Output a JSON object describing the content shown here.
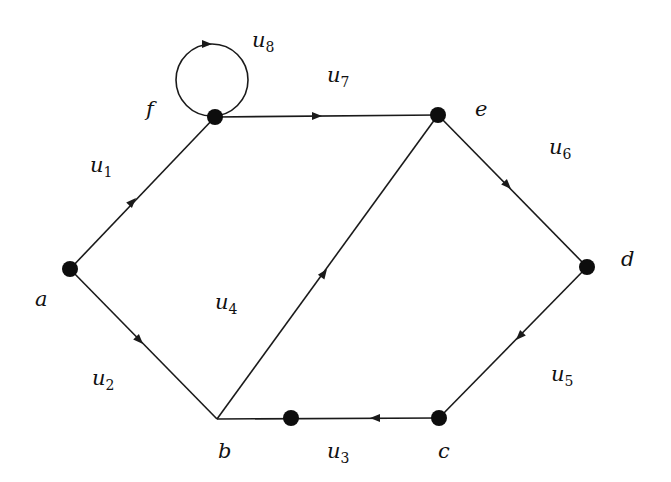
{
  "diagram": {
    "type": "directed-graph",
    "vertices": [
      {
        "id": "a",
        "label": "a",
        "x": 70,
        "y": 269,
        "lx": 35,
        "ly": 306,
        "dot": true
      },
      {
        "id": "b",
        "label": "b",
        "x": 217,
        "y": 419,
        "lx": 218,
        "ly": 458,
        "dot": false
      },
      {
        "id": "c",
        "label": "c",
        "x": 439,
        "y": 418,
        "lx": 438,
        "ly": 458,
        "dot": true
      },
      {
        "id": "d",
        "label": "d",
        "x": 587,
        "y": 267,
        "lx": 621,
        "ly": 266,
        "dot": true
      },
      {
        "id": "e",
        "label": "e",
        "x": 438,
        "y": 115,
        "lx": 475,
        "ly": 116,
        "dot": true
      },
      {
        "id": "f",
        "label": "f",
        "x": 215,
        "y": 117,
        "lx": 146,
        "ly": 116,
        "dot": true
      },
      {
        "id": "m",
        "label": "",
        "x": 291,
        "y": 418,
        "dot": true
      }
    ],
    "edges": [
      {
        "id": "u1",
        "name": "u",
        "sub": "1",
        "from": "a",
        "to": "f",
        "lx": 90,
        "ly": 172,
        "ax": 136,
        "ay": 198
      },
      {
        "id": "u2",
        "name": "u",
        "sub": "2",
        "from": "a",
        "to": "b",
        "lx": 92,
        "ly": 385,
        "ax": 143,
        "ay": 344
      },
      {
        "id": "u3",
        "name": "u",
        "sub": "3",
        "from": "c",
        "to": "b",
        "lx": 327,
        "ly": 458,
        "ax": 373,
        "ay": 418
      },
      {
        "id": "u4",
        "name": "u",
        "sub": "4",
        "from": "b",
        "to": "e",
        "lx": 215,
        "ly": 309,
        "ax": 325,
        "ay": 272
      },
      {
        "id": "u5",
        "name": "u",
        "sub": "5",
        "from": "d",
        "to": "c",
        "lx": 551,
        "ly": 381,
        "ax": 518,
        "ay": 338
      },
      {
        "id": "u6",
        "name": "u",
        "sub": "6",
        "from": "e",
        "to": "d",
        "lx": 549,
        "ly": 154,
        "ax": 509,
        "ay": 186
      },
      {
        "id": "u7",
        "name": "u",
        "sub": "7",
        "from": "f",
        "to": "e",
        "lx": 327,
        "ly": 82,
        "ax": 320,
        "ay": 117
      },
      {
        "id": "u8",
        "name": "u",
        "sub": "8",
        "from": "f",
        "to": "f",
        "loop": true,
        "lx": 252,
        "ly": 47,
        "ax": 207,
        "ay": 41
      }
    ]
  }
}
